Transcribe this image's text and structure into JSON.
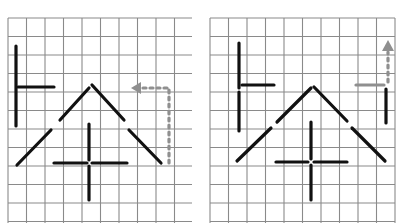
{
  "colors": {
    "background": "#ffffff",
    "grid": "#8a8a8a",
    "ink": "#111111",
    "move_indicator": "#8f8f8f"
  },
  "grid": {
    "cell_size": 18.5,
    "columns": 10,
    "rows": 11
  },
  "panels": [
    {
      "id": "before",
      "origin_x": 8,
      "origin_y": 18,
      "right_edge": 192,
      "bottom_edge": 223,
      "sticks": [
        {
          "x1": 16,
          "y1": 46,
          "x2": 16,
          "y2": 126
        },
        {
          "x1": 18,
          "y1": 87,
          "x2": 54,
          "y2": 87
        },
        {
          "x1": 89,
          "y1": 88,
          "x2": 60,
          "y2": 120
        },
        {
          "x1": 51,
          "y1": 130,
          "x2": 17,
          "y2": 165
        },
        {
          "x1": 92,
          "y1": 85,
          "x2": 124,
          "y2": 120
        },
        {
          "x1": 129,
          "y1": 130,
          "x2": 161,
          "y2": 163
        },
        {
          "x1": 54,
          "y1": 163,
          "x2": 87,
          "y2": 163
        },
        {
          "x1": 92,
          "y1": 163,
          "x2": 127,
          "y2": 163
        },
        {
          "x1": 89,
          "y1": 124,
          "x2": 89,
          "y2": 160
        },
        {
          "x1": 89,
          "y1": 166,
          "x2": 89,
          "y2": 200
        }
      ],
      "move": {
        "direction": "left",
        "path": [
          [
            169,
            163
          ],
          [
            169,
            88
          ],
          [
            140,
            88
          ]
        ],
        "arrow_tip": [
          131,
          85
        ]
      }
    },
    {
      "id": "after",
      "origin_x": 210,
      "origin_y": 18,
      "right_edge": 403,
      "bottom_edge": 223,
      "sticks": [
        {
          "x1": 239,
          "y1": 43,
          "x2": 239,
          "y2": 88
        },
        {
          "x1": 239,
          "y1": 92,
          "x2": 239,
          "y2": 131
        },
        {
          "x1": 242,
          "y1": 85,
          "x2": 274,
          "y2": 85
        },
        {
          "x1": 311,
          "y1": 88,
          "x2": 277,
          "y2": 122
        },
        {
          "x1": 271,
          "y1": 128,
          "x2": 237,
          "y2": 161
        },
        {
          "x1": 314,
          "y1": 87,
          "x2": 347,
          "y2": 121
        },
        {
          "x1": 352,
          "y1": 128,
          "x2": 385,
          "y2": 161
        },
        {
          "x1": 276,
          "y1": 162,
          "x2": 308,
          "y2": 162
        },
        {
          "x1": 314,
          "y1": 162,
          "x2": 347,
          "y2": 162
        },
        {
          "x1": 311,
          "y1": 122,
          "x2": 311,
          "y2": 159
        },
        {
          "x1": 311,
          "y1": 165,
          "x2": 311,
          "y2": 200
        },
        {
          "x1": 386,
          "y1": 89,
          "x2": 386,
          "y2": 123
        }
      ],
      "ghost_stick": {
        "x1": 356,
        "y1": 85,
        "x2": 384,
        "y2": 85
      },
      "move": {
        "direction": "up",
        "path": [
          [
            388,
            82
          ],
          [
            388,
            52
          ]
        ],
        "arrow_tip": [
          388,
          40
        ]
      }
    }
  ]
}
